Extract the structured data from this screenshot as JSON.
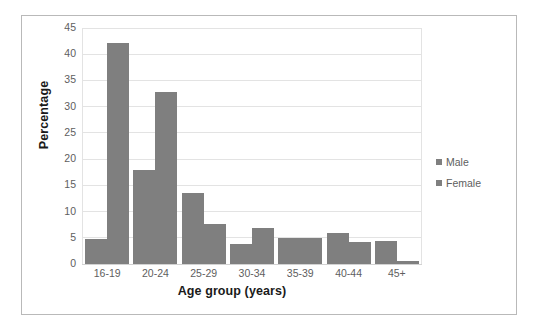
{
  "chart_data": {
    "type": "bar",
    "title": "",
    "xlabel": "Age group (years)",
    "ylabel": "Percentage",
    "categories": [
      "16-19",
      "20-24",
      "25-29",
      "30-34",
      "35-39",
      "40-44",
      "45+"
    ],
    "series": [
      {
        "name": "Male",
        "values": [
          4.7,
          18.0,
          13.5,
          3.9,
          4.9,
          5.9,
          4.3
        ]
      },
      {
        "name": "Female",
        "values": [
          42.1,
          32.8,
          7.7,
          6.8,
          5.0,
          4.2,
          0.6
        ]
      }
    ],
    "ylim": [
      0,
      45
    ],
    "yticks": [
      0,
      5,
      10,
      15,
      20,
      25,
      30,
      35,
      40,
      45
    ],
    "ytick_labels": [
      "0",
      "5",
      "10",
      "15",
      "20",
      "25",
      "30",
      "35",
      "40",
      "45"
    ],
    "grid": true,
    "grid_axis": "y",
    "legend_position": "right",
    "legend": [
      "Male",
      "Female"
    ],
    "colors": {
      "male": "#7f7f7f",
      "female": "#7f7f7f",
      "gridline": "#e3e3e3",
      "text": "#5e5e5e",
      "axis_title": "#1a1a1a",
      "frame": "#b9b9b9",
      "background": "#ffffff"
    }
  },
  "figure": {
    "border_color": "#b9b9b9",
    "background": "#ffffff"
  }
}
